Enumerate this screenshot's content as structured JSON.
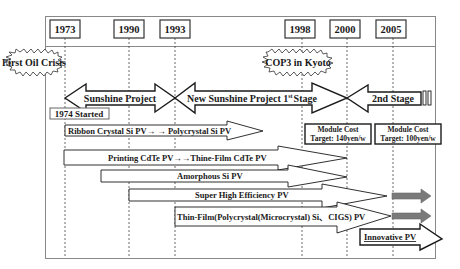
{
  "timeline": {
    "years": [
      {
        "label": "1973",
        "x": 65
      },
      {
        "label": "1990",
        "x": 129
      },
      {
        "label": "1993",
        "x": 175
      },
      {
        "label": "1998",
        "x": 302
      },
      {
        "label": "2000",
        "x": 347
      },
      {
        "label": "2005",
        "x": 393
      }
    ]
  },
  "events": {
    "first_oil_crisis": "First Oil Crisis",
    "cop3": "COP3 in Kyoto",
    "started_1974": "1974 Started"
  },
  "projects": {
    "sunshine": "Sunshine Project",
    "new_sunshine": "New Sunshine Project 1st Stage",
    "new_sunshine_main": "New Sunshine Project 1",
    "new_sunshine_sup": "st",
    "new_sunshine_tail": "Stage",
    "second_stage": "2nd Stage"
  },
  "targets": [
    {
      "line1": "Module Cost",
      "line2": "Target: 140yen/w"
    },
    {
      "line1": "Module Cost",
      "line2": "Target: 100yen/w"
    }
  ],
  "technologies": [
    {
      "label": "Ribbon Crystal Si PV→ → Polycrystal  Si PV"
    },
    {
      "label": "Printing CdTe PV→→Thine-Film CdTe PV"
    },
    {
      "label": "Amorphous Si PV"
    },
    {
      "label": "Super High Efficiency PV"
    },
    {
      "label": "Thin-Film(Polycrystal(Microcrystal) Si、CIGS) PV"
    },
    {
      "label": "Innovative PV"
    }
  ]
}
